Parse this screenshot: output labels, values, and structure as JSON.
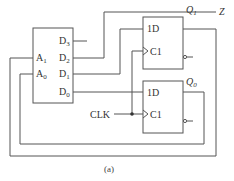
{
  "diagram": {
    "caption": "(a)",
    "output_label": "Z",
    "clock_label": "CLK",
    "mux": {
      "inputs": [
        {
          "name": "D",
          "sub": "3"
        },
        {
          "name": "D",
          "sub": "2"
        },
        {
          "name": "D",
          "sub": "1"
        },
        {
          "name": "D",
          "sub": "0"
        }
      ],
      "selects": [
        {
          "name": "A",
          "sub": "1"
        },
        {
          "name": "A",
          "sub": "0"
        }
      ]
    },
    "flip_flops": [
      {
        "d_label": "1D",
        "clk_label": "C1",
        "q_name": "Q",
        "q_sub": "1"
      },
      {
        "d_label": "1D",
        "clk_label": "C1",
        "q_name": "Q",
        "q_sub": "0"
      }
    ],
    "colors": {
      "line": "#555555",
      "text": "#333333",
      "background": "#ffffff"
    }
  }
}
